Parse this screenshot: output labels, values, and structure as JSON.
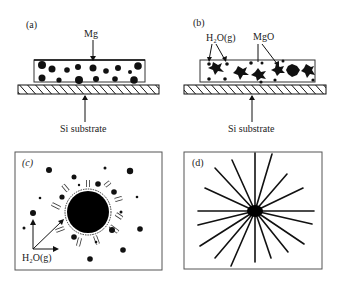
{
  "panels": {
    "a": {
      "label": "(a)",
      "top_label": "Mg",
      "bottom_label": "Si substrate"
    },
    "b": {
      "label": "(b)",
      "left_label": "H₂O(g)",
      "right_label": "MgO",
      "bottom_label": "Si substrate"
    },
    "c": {
      "label": "(c)",
      "bottom_label": "H₂O(g)"
    },
    "d": {
      "label": "(d)"
    }
  },
  "colors": {
    "ink": "#111111",
    "frame": "#555555",
    "background": "#ffffff"
  }
}
